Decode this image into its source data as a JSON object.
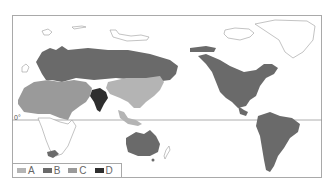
{
  "map": {
    "equator_label": "0°",
    "legend": [
      {
        "key": "A",
        "label": "A",
        "color": "#b4b4b4"
      },
      {
        "key": "B",
        "label": "B",
        "color": "#6a6a6a"
      },
      {
        "key": "C",
        "label": "C",
        "color": "#9a9a9a"
      },
      {
        "key": "D",
        "label": "D",
        "color": "#2e2e2e"
      }
    ],
    "regions": [
      {
        "name": "Europe & Northern Asia",
        "class": "B"
      },
      {
        "name": "North Africa & Middle East",
        "class": "C"
      },
      {
        "name": "China & Southeast Asia",
        "class": "A"
      },
      {
        "name": "India",
        "class": "D"
      },
      {
        "name": "Australia",
        "class": "B"
      },
      {
        "name": "North America",
        "class": "B"
      },
      {
        "name": "South America",
        "class": "B"
      },
      {
        "name": "Southern Africa tip",
        "class": "B"
      }
    ]
  }
}
